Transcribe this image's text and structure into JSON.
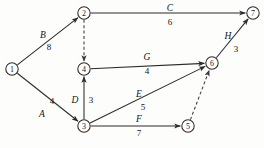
{
  "diagram": {
    "kind": "activity-on-arrow-project-network",
    "colors": {
      "line": "#2b2b2b",
      "dummy_line": "#3a3a3a",
      "node_fill": "#ffffff",
      "text": "#141414",
      "background": "#fdfdfb"
    },
    "nodes": [
      {
        "id": "1",
        "label": "1",
        "x": 12,
        "y": 69,
        "r": 6.2
      },
      {
        "id": "2",
        "label": "2",
        "x": 84,
        "y": 13,
        "r": 6.2
      },
      {
        "id": "3",
        "label": "3",
        "x": 84,
        "y": 126,
        "r": 6.2
      },
      {
        "id": "4",
        "label": "4",
        "x": 84,
        "y": 69,
        "r": 6.2
      },
      {
        "id": "5",
        "label": "5",
        "x": 188,
        "y": 126,
        "r": 6.2
      },
      {
        "id": "6",
        "label": "6",
        "x": 212,
        "y": 63,
        "r": 6.2
      },
      {
        "id": "7",
        "label": "7",
        "x": 253,
        "y": 13,
        "r": 6.2
      }
    ],
    "edges": [
      {
        "id": "edge-B",
        "activity": "B",
        "duration": "8",
        "from": "1",
        "to": "2",
        "style": "solid",
        "name_x": 43,
        "name_y": 38,
        "dur_x": 49,
        "dur_y": 50
      },
      {
        "id": "edge-A",
        "activity": "A",
        "duration": "4",
        "from": "1",
        "to": "3",
        "style": "solid",
        "name_x": 42,
        "name_y": 117,
        "dur_x": 52,
        "dur_y": 104
      },
      {
        "id": "edge-C",
        "activity": "C",
        "duration": "6",
        "from": "2",
        "to": "7",
        "style": "solid",
        "name_x": 170,
        "name_y": 11,
        "dur_x": 170,
        "dur_y": 25
      },
      {
        "id": "edge-dummy-2-4",
        "activity": "",
        "duration": "",
        "from": "2",
        "to": "4",
        "style": "dashed",
        "name_x": 0,
        "name_y": 0,
        "dur_x": 0,
        "dur_y": 0
      },
      {
        "id": "edge-D",
        "activity": "D",
        "duration": "3",
        "from": "3",
        "to": "4",
        "style": "solid",
        "name_x": 75,
        "name_y": 103,
        "dur_x": 91,
        "dur_y": 103
      },
      {
        "id": "edge-G",
        "activity": "G",
        "duration": "4",
        "from": "4",
        "to": "6",
        "style": "solid",
        "name_x": 147,
        "name_y": 60,
        "dur_x": 147,
        "dur_y": 74
      },
      {
        "id": "edge-E",
        "activity": "E",
        "duration": "5",
        "from": "3",
        "to": "6",
        "style": "solid",
        "name_x": 139,
        "name_y": 97,
        "dur_x": 143,
        "dur_y": 110
      },
      {
        "id": "edge-F",
        "activity": "F",
        "duration": "7",
        "from": "3",
        "to": "5",
        "style": "solid",
        "name_x": 139,
        "name_y": 122,
        "dur_x": 139,
        "dur_y": 136
      },
      {
        "id": "edge-dummy-5-6",
        "activity": "",
        "duration": "",
        "from": "5",
        "to": "6",
        "style": "dashed",
        "name_x": 0,
        "name_y": 0,
        "dur_x": 0,
        "dur_y": 0
      },
      {
        "id": "edge-H",
        "activity": "H",
        "duration": "3",
        "from": "6",
        "to": "7",
        "style": "solid",
        "name_x": 228,
        "name_y": 39,
        "dur_x": 236,
        "dur_y": 52
      }
    ]
  }
}
